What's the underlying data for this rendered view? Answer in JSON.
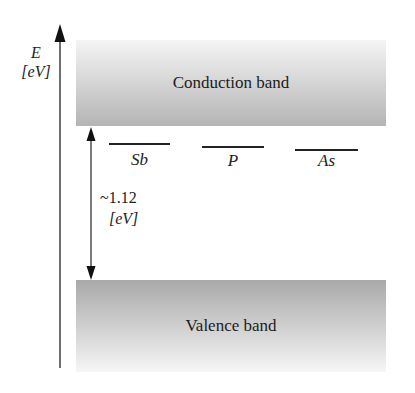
{
  "diagram": {
    "axis": {
      "symbol": "E",
      "unit": "[eV]"
    },
    "bands": {
      "conduction": "Conduction band",
      "valence": "Valence band"
    },
    "gap": {
      "value": "~1.12",
      "unit": "[eV]"
    },
    "donor_levels": [
      {
        "label": "Sb"
      },
      {
        "label": "P"
      },
      {
        "label": "As"
      }
    ],
    "colors": {
      "band_dark": "#a9a9a9",
      "band_light": "#f4f4f4",
      "line": "#222222"
    }
  }
}
